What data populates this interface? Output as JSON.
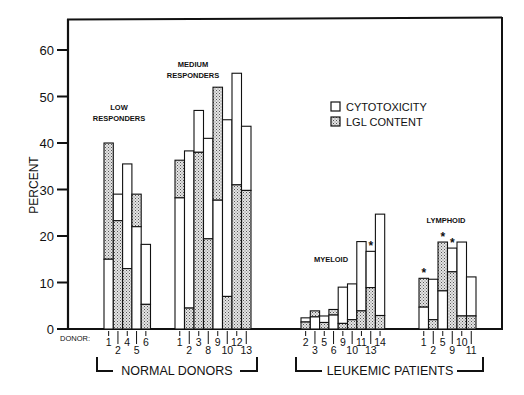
{
  "chart_data": {
    "type": "bar",
    "subtype": "overlaid-stacked",
    "title": "",
    "ylabel": "PERCENT",
    "xlabel": "DONOR:",
    "ylim": [
      0,
      65
    ],
    "yticks": [
      0,
      10,
      20,
      30,
      40,
      50,
      60
    ],
    "grid": false,
    "legend": {
      "position": "upper-right",
      "entries": [
        {
          "label": "CYTOTOXICITY",
          "fill": "open"
        },
        {
          "label": "LGL CONTENT",
          "fill": "stippled"
        }
      ]
    },
    "groups": [
      {
        "name": "NORMAL DONORS",
        "subgroups": [
          {
            "label": "LOW RESPONDERS",
            "donors": [
              "1",
              "2",
              "4",
              "5",
              "6"
            ],
            "series": [
              {
                "name": "CYTOTOXICITY",
                "values": [
                  15,
                  29,
                  35.5,
                  22,
                  18.2
                ]
              },
              {
                "name": "LGL CONTENT",
                "values": [
                  40,
                  23.3,
                  13,
                  29,
                  5.3
                ]
              }
            ],
            "starred": []
          },
          {
            "label": "MEDIUM RESPONDERS",
            "donors": [
              "1",
              "2",
              "3",
              "8",
              "9",
              "10",
              "12",
              "13"
            ],
            "series": [
              {
                "name": "CYTOTOXICITY",
                "values": [
                  28.2,
                  38.3,
                  47,
                  41,
                  27.7,
                  45,
                  55,
                  43.6
                ]
              },
              {
                "name": "LGL CONTENT",
                "values": [
                  36.3,
                  4.5,
                  38,
                  19.4,
                  52,
                  7,
                  31,
                  29.8
                ]
              }
            ],
            "starred": []
          }
        ]
      },
      {
        "name": "LEUKEMIC PATIENTS",
        "subgroups": [
          {
            "label": "MYELOID",
            "donors": [
              "2",
              "3",
              "5",
              "6",
              "9",
              "10",
              "11",
              "13",
              "14"
            ],
            "series": [
              {
                "name": "CYTOTOXICITY",
                "values": [
                  2.4,
                  2.6,
                  2.8,
                  3.0,
                  9,
                  9.7,
                  18.8,
                  16.7,
                  24.7
                ]
              },
              {
                "name": "LGL CONTENT",
                "values": [
                  1.5,
                  3.9,
                  1.4,
                  4.2,
                  1.2,
                  2.0,
                  3.9,
                  8.9,
                  2.9
                ]
              }
            ],
            "starred": [
              "13"
            ]
          },
          {
            "label": "LYMPHOID",
            "donors": [
              "1",
              "2",
              "5",
              "9",
              "10",
              "11"
            ],
            "series": [
              {
                "name": "CYTOTOXICITY",
                "values": [
                  4.7,
                  10.7,
                  8.2,
                  17.4,
                  18.7,
                  11.2
                ]
              },
              {
                "name": "LGL CONTENT",
                "values": [
                  10.9,
                  2.0,
                  18.7,
                  12.3,
                  2.8,
                  2.8
                ]
              }
            ],
            "starred": [
              "1",
              "5",
              "9"
            ]
          }
        ]
      }
    ]
  },
  "labels": {
    "y_axis_title": "PERCENT",
    "donor_prefix": "DONOR:",
    "group_normal": "NORMAL DONORS",
    "group_leukemic": "LEUKEMIC PATIENTS",
    "low_line1": "LOW",
    "low_line2": "RESPONDERS",
    "medium_line1": "MEDIUM",
    "medium_line2": "RESPONDERS",
    "myeloid": "MYELOID",
    "lymphoid": "LYMPHOID",
    "legend_cytotoxicity": "CYTOTOXICITY",
    "legend_lgl": "LGL CONTENT",
    "star": "*"
  }
}
